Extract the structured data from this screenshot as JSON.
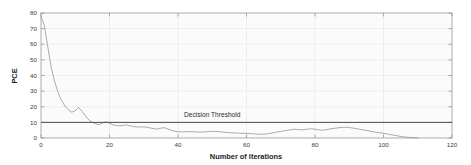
{
  "chart_data": {
    "type": "line",
    "title": "",
    "xlabel": "Number of Iterations",
    "ylabel": "PCE",
    "xlim": [
      0,
      120
    ],
    "ylim": [
      0,
      80
    ],
    "grid": true,
    "legend": null,
    "xticks": [
      0,
      20,
      40,
      60,
      80,
      100,
      120
    ],
    "xtick_labels": [
      "0",
      "20",
      "40",
      "60",
      "80",
      "100",
      "120"
    ],
    "yticks": [
      0,
      10,
      20,
      30,
      40,
      50,
      60,
      70,
      80
    ],
    "ytick_labels": [
      "0",
      "10",
      "20",
      "30",
      "40",
      "50",
      "60",
      "70",
      "80"
    ],
    "annotations": [
      {
        "text": "Decision Threshold",
        "x": 50,
        "y": 13.5
      }
    ],
    "reference_lines": [
      {
        "name": "decision-threshold",
        "orientation": "horizontal",
        "value": 10,
        "color": "#4a4a4a"
      }
    ],
    "series": [
      {
        "name": "PCE",
        "color": "#8f8f8f",
        "x": [
          0,
          1,
          2,
          3,
          4,
          5,
          6,
          7,
          8,
          9,
          10,
          11,
          12,
          13,
          14,
          15,
          16,
          17,
          18,
          19,
          20,
          21,
          22,
          23,
          24,
          25,
          26,
          27,
          28,
          29,
          30,
          31,
          32,
          33,
          34,
          35,
          36,
          37,
          38,
          39,
          40,
          41,
          42,
          43,
          44,
          45,
          46,
          47,
          48,
          49,
          50,
          51,
          52,
          53,
          54,
          55,
          56,
          57,
          58,
          59,
          60,
          61,
          62,
          63,
          64,
          65,
          66,
          67,
          68,
          69,
          70,
          71,
          72,
          73,
          74,
          75,
          76,
          77,
          78,
          79,
          80,
          81,
          82,
          83,
          84,
          85,
          86,
          87,
          88,
          89,
          90,
          91,
          92,
          93,
          94,
          95,
          96,
          97,
          98,
          99,
          100,
          101,
          102,
          103,
          104,
          105,
          106,
          107,
          108,
          109,
          110
        ],
        "values": [
          77.5,
          72.0,
          58.0,
          45.0,
          36.0,
          29.0,
          24.0,
          20.5,
          18.0,
          16.5,
          17.5,
          19.5,
          17.0,
          14.0,
          11.5,
          10.0,
          9.0,
          8.6,
          9.6,
          10.4,
          9.4,
          8.4,
          8.0,
          7.9,
          8.1,
          8.4,
          7.8,
          7.3,
          7.1,
          7.0,
          7.2,
          6.8,
          6.4,
          6.0,
          5.7,
          6.3,
          6.6,
          5.8,
          5.0,
          4.4,
          4.0,
          3.9,
          4.0,
          4.1,
          4.0,
          3.9,
          3.8,
          3.8,
          3.9,
          4.1,
          4.3,
          4.2,
          4.0,
          3.8,
          3.6,
          3.4,
          3.3,
          3.2,
          3.1,
          3.0,
          2.9,
          2.8,
          2.7,
          2.5,
          2.4,
          2.4,
          2.6,
          3.0,
          3.4,
          3.8,
          4.2,
          4.6,
          5.0,
          5.3,
          5.6,
          5.4,
          5.2,
          5.4,
          5.7,
          5.9,
          5.6,
          5.3,
          5.0,
          5.2,
          5.6,
          6.0,
          6.3,
          6.6,
          6.8,
          6.9,
          6.7,
          6.4,
          6.0,
          5.6,
          5.2,
          4.8,
          4.4,
          4.0,
          3.6,
          3.3,
          3.0,
          2.6,
          2.2,
          1.8,
          1.4,
          1.0,
          0.7,
          0.5,
          0.3,
          0.2,
          0.1
        ]
      }
    ]
  }
}
